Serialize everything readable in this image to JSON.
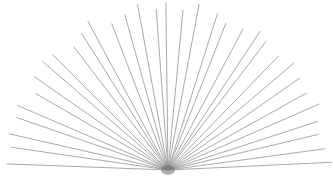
{
  "figure": {
    "type": "radial-line-burst",
    "width": 333,
    "height": 189,
    "background_color": "#ffffff",
    "line_color": "#8c8c8c",
    "line_width": 0.75,
    "hub_color": "#6f6f6f"
  },
  "chart_data": {
    "type": "line",
    "title": "",
    "xlabel": "",
    "ylabel": "",
    "grid": false,
    "legend": "none",
    "origin": {
      "x": 168,
      "y": 170
    },
    "ray_count": 33,
    "angle_start_deg": 2,
    "angle_end_deg": 178,
    "radius_x": 163,
    "radius_y": 168,
    "tip_jitter": 4,
    "angles_deg": [
      2,
      7.5,
      13,
      18.5,
      24,
      29.5,
      35,
      40.5,
      46,
      51.5,
      57,
      62.5,
      68,
      73.5,
      79,
      84.5,
      90,
      95.5,
      101,
      106.5,
      112,
      117.5,
      123,
      128.5,
      134,
      139.5,
      145,
      150.5,
      156,
      161.5,
      167,
      172.5,
      178
    ],
    "radii": [
      162,
      158,
      155,
      160,
      163,
      157,
      161,
      166,
      159,
      164,
      168,
      161,
      157,
      165,
      170,
      163,
      167,
      164,
      169,
      162,
      158,
      166,
      161,
      157,
      163,
      168,
      160,
      156,
      162,
      159,
      164,
      157,
      161
    ],
    "xlim": [
      0,
      333
    ],
    "ylim": [
      0,
      189
    ]
  }
}
